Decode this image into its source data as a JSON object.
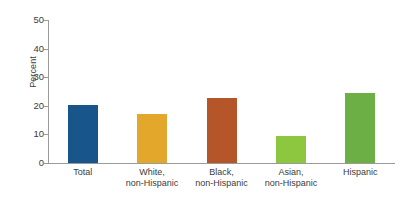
{
  "chart_data": {
    "type": "bar",
    "title": "",
    "subtitle": "",
    "xlabel": "",
    "ylabel": "Percent",
    "ylim": [
      0,
      50
    ],
    "yticks": [
      0,
      10,
      20,
      30,
      40,
      50
    ],
    "ytick_labels": [
      "0",
      "10",
      "20",
      "30",
      "40",
      "50"
    ],
    "grid": false,
    "legend": "none",
    "categories": [
      "Total",
      "White, non-Hispanic",
      "Black, non-Hispanic",
      "Asian, non-Hispanic",
      "Hispanic"
    ],
    "category_lines": [
      [
        "Total",
        ""
      ],
      [
        "White,",
        "non-Hispanic"
      ],
      [
        "Black,",
        "non-Hispanic"
      ],
      [
        "Asian,",
        "non-Hispanic"
      ],
      [
        "Hispanic",
        ""
      ]
    ],
    "values": [
      20.3,
      17.0,
      22.7,
      9.5,
      24.4
    ],
    "colors": [
      "#17558a",
      "#e3a72b",
      "#b5562a",
      "#8dc63f",
      "#6caf44"
    ],
    "axis_color": "#9a9a9a",
    "text_color": "#3b3b3b",
    "background": "#ffffff"
  }
}
